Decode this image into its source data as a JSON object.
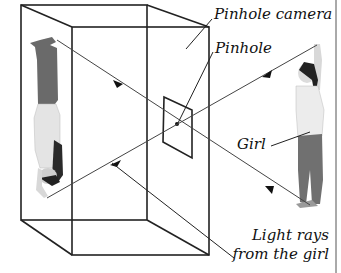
{
  "diagram": {
    "title": "Pinhole camera",
    "labels": {
      "camera": "Pinhole camera",
      "pinhole": "Pinhole",
      "girl": "Girl",
      "rays_line1": "Light rays",
      "rays_line2": "from the girl"
    },
    "colors": {
      "line": "#222222",
      "ray": "#444444",
      "background": "#ffffff"
    }
  }
}
